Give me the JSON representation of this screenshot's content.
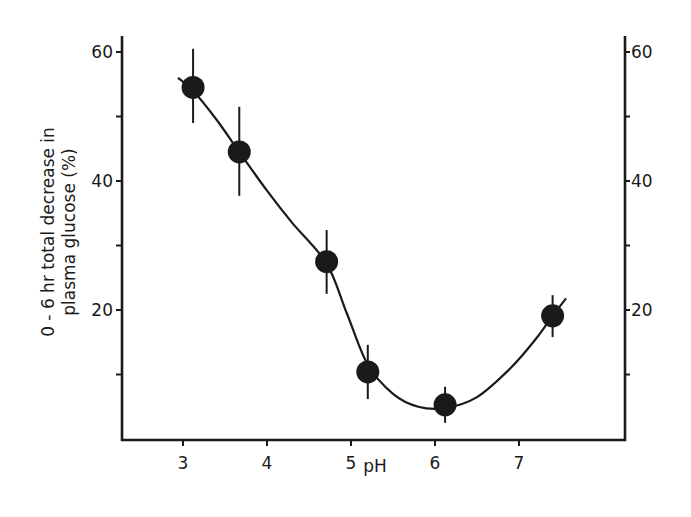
{
  "chart_data": {
    "type": "scatter",
    "title": "",
    "xlabel": "pH",
    "ylabel_lines": [
      "0 - 6 hr  total  decrease  in",
      "plasma  glucose     (%)"
    ],
    "ylabel": "0 - 6 hr total decrease in plasma glucose (%)",
    "xlim": [
      2.55,
      8.3
    ],
    "ylim": [
      0,
      62.5
    ],
    "x_ticks": [
      3,
      4,
      5,
      6,
      7
    ],
    "x_tick_labels": [
      "3",
      "4",
      "5",
      "6",
      "7"
    ],
    "y_ticks_major": [
      20,
      40,
      60
    ],
    "y_ticks_minor": [
      10,
      30,
      50
    ],
    "y_tick_labels": [
      "20",
      "40",
      "60"
    ],
    "right_axis_tick_labels": [
      "20",
      "40",
      "60"
    ],
    "grid": false,
    "legend": null,
    "series": [
      {
        "name": "measured",
        "points": [
          {
            "x": 3.12,
            "y": 54.5,
            "err_low": 49.0,
            "err_high": 60.5
          },
          {
            "x": 3.67,
            "y": 44.5,
            "err_low": 37.7,
            "err_high": 51.5
          },
          {
            "x": 4.71,
            "y": 27.5,
            "err_low": 22.5,
            "err_high": 32.4
          },
          {
            "x": 5.2,
            "y": 10.4,
            "err_low": 6.2,
            "err_high": 14.6
          },
          {
            "x": 6.12,
            "y": 5.3,
            "err_low": 2.5,
            "err_high": 8.1
          },
          {
            "x": 7.4,
            "y": 19.1,
            "err_low": 15.8,
            "err_high": 22.3
          }
        ]
      },
      {
        "name": "fitted-curve",
        "type": "line",
        "x": [
          2.94,
          3.12,
          3.4,
          3.67,
          4.0,
          4.3,
          4.71,
          4.95,
          5.2,
          5.5,
          5.8,
          6.12,
          6.5,
          6.9,
          7.2,
          7.4,
          7.56
        ],
        "y": [
          56.0,
          54.0,
          49.5,
          44.5,
          38.5,
          33.5,
          27.2,
          19.5,
          11.5,
          7.0,
          5.0,
          4.8,
          6.5,
          11.0,
          15.5,
          19.1,
          21.8
        ]
      }
    ]
  },
  "plot_area": {
    "left": 122,
    "right": 625,
    "top": 36,
    "bottom": 440
  },
  "colors": {
    "ink": "#1a1a1a",
    "background": "#ffffff"
  }
}
